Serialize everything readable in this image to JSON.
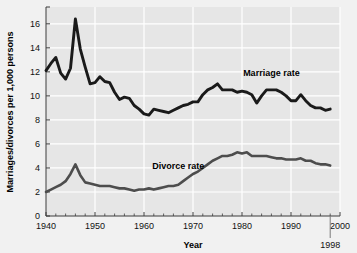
{
  "chart_data": {
    "type": "line",
    "title": "",
    "xlabel": "Year",
    "ylabel": "Marriages/divorces per 1,000 persons",
    "xlim": [
      1940,
      2000
    ],
    "ylim": [
      0,
      17.4
    ],
    "grid": true,
    "legend_position": "inline-annotations",
    "xticks": [
      1940,
      1950,
      1960,
      1970,
      1980,
      1990,
      2000
    ],
    "yticks": [
      0,
      2,
      4,
      6,
      8,
      10,
      12,
      14,
      16
    ],
    "annotations": [
      {
        "text": "Marriage rate",
        "x": 1986,
        "y": 11.9
      },
      {
        "text": "Divorce rate",
        "x": 1967,
        "y": 4.2
      },
      {
        "text": "1998",
        "x": 1998,
        "y": -1.25
      }
    ],
    "series": [
      {
        "name": "Marriage rate",
        "color": "#1a1a1a",
        "x": [
          1940,
          1941,
          1942,
          1943,
          1944,
          1945,
          1946,
          1947,
          1948,
          1949,
          1950,
          1951,
          1952,
          1953,
          1954,
          1955,
          1956,
          1957,
          1958,
          1959,
          1960,
          1961,
          1962,
          1963,
          1964,
          1965,
          1966,
          1967,
          1968,
          1969,
          1970,
          1971,
          1972,
          1973,
          1974,
          1975,
          1976,
          1977,
          1978,
          1979,
          1980,
          1981,
          1982,
          1983,
          1984,
          1985,
          1986,
          1987,
          1988,
          1989,
          1990,
          1991,
          1992,
          1993,
          1994,
          1995,
          1996,
          1997,
          1998
        ],
        "values": [
          12.1,
          12.7,
          13.2,
          11.9,
          11.4,
          12.3,
          16.4,
          13.9,
          12.4,
          11.0,
          11.1,
          11.6,
          11.2,
          11.1,
          10.3,
          9.7,
          9.9,
          9.8,
          9.2,
          8.9,
          8.5,
          8.4,
          8.9,
          8.8,
          8.7,
          8.6,
          8.8,
          9.0,
          9.2,
          9.3,
          9.5,
          9.5,
          10.1,
          10.5,
          10.7,
          11.0,
          10.5,
          10.5,
          10.5,
          10.3,
          10.4,
          10.3,
          10.1,
          9.4,
          10.0,
          10.5,
          10.5,
          10.5,
          10.3,
          10.0,
          9.6,
          9.6,
          10.1,
          9.6,
          9.2,
          9.0,
          9.0,
          8.8,
          8.9
        ]
      },
      {
        "name": "Divorce rate",
        "color": "#4d4d4d",
        "x": [
          1940,
          1941,
          1942,
          1943,
          1944,
          1945,
          1946,
          1947,
          1948,
          1949,
          1950,
          1951,
          1952,
          1953,
          1954,
          1955,
          1956,
          1957,
          1958,
          1959,
          1960,
          1961,
          1962,
          1963,
          1964,
          1965,
          1966,
          1967,
          1968,
          1969,
          1970,
          1971,
          1972,
          1973,
          1974,
          1975,
          1976,
          1977,
          1978,
          1979,
          1980,
          1981,
          1982,
          1983,
          1984,
          1985,
          1986,
          1987,
          1988,
          1989,
          1990,
          1991,
          1992,
          1993,
          1994,
          1995,
          1996,
          1997,
          1998
        ],
        "values": [
          2.0,
          2.2,
          2.4,
          2.6,
          2.9,
          3.5,
          4.3,
          3.4,
          2.8,
          2.7,
          2.6,
          2.5,
          2.5,
          2.5,
          2.4,
          2.3,
          2.3,
          2.2,
          2.1,
          2.2,
          2.2,
          2.3,
          2.2,
          2.3,
          2.4,
          2.5,
          2.5,
          2.6,
          2.9,
          3.2,
          3.5,
          3.7,
          4.0,
          4.3,
          4.6,
          4.8,
          5.0,
          5.0,
          5.1,
          5.3,
          5.2,
          5.3,
          5.0,
          5.0,
          5.0,
          5.0,
          4.9,
          4.8,
          4.8,
          4.7,
          4.7,
          4.7,
          4.8,
          4.6,
          4.6,
          4.4,
          4.3,
          4.3,
          4.2
        ]
      }
    ]
  },
  "axis": {
    "ylabel": "Marriages/divorces per 1,000 persons",
    "xlabel": "Year",
    "end_year_label": "1998"
  },
  "labels": {
    "marriage": "Marriage rate",
    "divorce": "Divorce rate"
  },
  "colors": {
    "plot_background": "#e6e6e6",
    "outer_background": "#f1f1f1",
    "gridline": "#ffffff",
    "marriage_line": "#1a1a1a",
    "divorce_line": "#4d4d4d",
    "axis": "#3d3d3d",
    "text": "#111111"
  }
}
